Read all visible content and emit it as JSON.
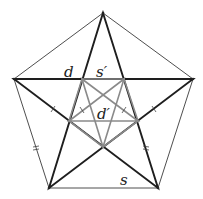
{
  "diagram": {
    "outer_vertices": [
      [
        103,
        13
      ],
      [
        193,
        79
      ],
      [
        158,
        188
      ],
      [
        49,
        188
      ],
      [
        14,
        79
      ]
    ],
    "inner_vertices": [
      [
        82,
        79
      ],
      [
        124,
        79
      ],
      [
        138,
        121
      ],
      [
        103,
        147
      ],
      [
        69,
        121
      ]
    ],
    "labels": {
      "d": "d",
      "s_prime": "s′",
      "d_prime": "d′",
      "s": "s"
    },
    "label_positions": {
      "d": [
        69,
        78
      ],
      "s_prime": [
        102,
        78
      ],
      "d_prime": [
        103,
        116
      ],
      "s": [
        124,
        186
      ]
    },
    "colors": {
      "outer_side": "#3a3a3a",
      "star": "#1e1e1e",
      "inner": "#8a8a8a",
      "label": "#222222"
    }
  }
}
